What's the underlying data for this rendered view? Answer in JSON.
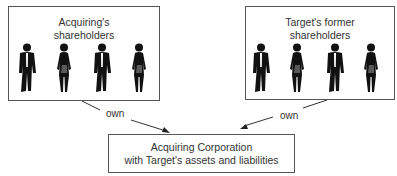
{
  "diagram": {
    "groups": [
      {
        "id": "acquiring",
        "title_line1": "Acquiring's",
        "title_line2": "shareholders",
        "figures": [
          "man-silhouette-icon",
          "woman-silhouette-icon",
          "man-silhouette-icon",
          "woman-silhouette-icon"
        ]
      },
      {
        "id": "target",
        "title_line1": "Target's former",
        "title_line2": "shareholders",
        "figures": [
          "man-silhouette-icon",
          "woman-silhouette-icon",
          "man-silhouette-icon",
          "woman-silhouette-icon"
        ]
      }
    ],
    "arrows": [
      {
        "from": "acquiring",
        "to": "corporation",
        "label": "own"
      },
      {
        "from": "target",
        "to": "corporation",
        "label": "own"
      }
    ],
    "corporation": {
      "line1": "Acquiring Corporation",
      "line2": "with Target's assets and liabilities"
    },
    "colors": {
      "border": "#555555",
      "silhouette": "#111111",
      "text": "#333333"
    }
  }
}
